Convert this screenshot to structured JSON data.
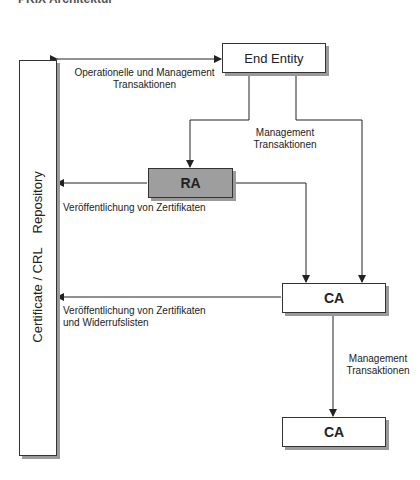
{
  "title": "PKIX Architektur",
  "nodes": {
    "repository": {
      "label": "Certificate / CRL    Repository"
    },
    "end_entity": {
      "label": "End Entity"
    },
    "ra": {
      "label": "RA"
    },
    "ca_main": {
      "label": "CA"
    },
    "ca_second": {
      "label": "CA"
    }
  },
  "labels": {
    "op_mgmt_1": "Operationelle und Management",
    "op_mgmt_2": "Transaktionen",
    "mgmt_ee_1": "Management",
    "mgmt_ee_2": "Transaktionen",
    "pub_ra": "Veröffentlichung von Zertifikaten",
    "pub_ca_1": "Veröffentlichung von Zertifikaten",
    "pub_ca_2": "und Widerrufslisten",
    "mgmt_ca_1": "Management",
    "mgmt_ca_2": "Transaktionen"
  },
  "colors": {
    "ra_fill": "#9e9e9e",
    "line": "#222222",
    "shadow": "#9a9a9a"
  }
}
